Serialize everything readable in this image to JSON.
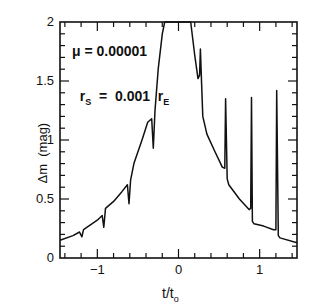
{
  "chart_data": {
    "type": "line",
    "title": "",
    "xlabel": "t/t0",
    "ylabel": "Δm (mag)",
    "xlim": [
      -1.46,
      1.46
    ],
    "ylim": [
      0,
      2
    ],
    "x_ticks": [
      -1,
      0,
      1
    ],
    "y_ticks": [
      0,
      0.5,
      1,
      1.5,
      2
    ],
    "grid": false,
    "legend": null,
    "annotations": [
      "μ = 0.00001",
      "r_S = 0.001 r_E"
    ],
    "series": [
      {
        "name": "light curve",
        "x": [
          -1.46,
          -1.3,
          -1.22,
          -1.19,
          -1.17,
          -1.0,
          -0.94,
          -0.92,
          -0.9,
          -0.8,
          -0.7,
          -0.63,
          -0.61,
          -0.59,
          -0.55,
          -0.45,
          -0.38,
          -0.33,
          -0.31,
          -0.29,
          -0.25,
          -0.2,
          -0.17,
          0.15,
          0.2,
          0.24,
          0.26,
          0.27,
          0.285,
          0.3,
          0.35,
          0.45,
          0.54,
          0.57,
          0.58,
          0.6,
          0.62,
          0.75,
          0.87,
          0.89,
          0.9,
          0.91,
          0.93,
          1.05,
          1.17,
          1.2,
          1.21,
          1.23,
          1.25,
          1.46
        ],
        "y": [
          0.15,
          0.19,
          0.22,
          0.18,
          0.24,
          0.32,
          0.36,
          0.26,
          0.42,
          0.48,
          0.56,
          0.62,
          0.46,
          0.66,
          0.8,
          1.0,
          1.15,
          1.18,
          0.93,
          1.25,
          1.6,
          1.9,
          2.0,
          2.0,
          1.72,
          1.52,
          1.55,
          1.77,
          1.48,
          1.2,
          1.05,
          0.9,
          0.77,
          0.76,
          1.35,
          0.67,
          0.62,
          0.5,
          0.41,
          0.42,
          1.36,
          0.31,
          0.29,
          0.27,
          0.24,
          0.24,
          1.42,
          0.19,
          0.17,
          0.13
        ]
      }
    ]
  },
  "axes": {
    "xlabel_main": "t/t",
    "xlabel_sub": "o",
    "ylabel": "Δm  (mag)",
    "x_tick_labels": [
      "−1",
      "0",
      "1"
    ],
    "y_tick_labels": [
      "0",
      "0.5",
      "1",
      "1.5",
      "2"
    ]
  },
  "annotation": {
    "mu_label": "μ  =  0.00001",
    "rs_main": "r",
    "rs_sub": "S",
    "rs_eq": "  =  0.001  r",
    "re_sub": "E"
  },
  "style": {
    "line_color": "#111111",
    "frame_color": "#111111"
  }
}
